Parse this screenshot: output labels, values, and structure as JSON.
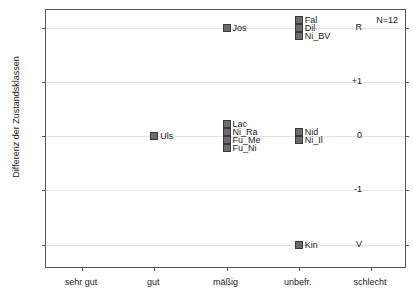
{
  "chart_data": {
    "type": "scatter",
    "title": "",
    "xlabel": "",
    "ylabel": "Differenz der Zustandsklassen",
    "annotation": "N=12",
    "grid": true,
    "legend": "none",
    "categories": [
      "sehr gut",
      "gut",
      "mäßig",
      "unbefr.",
      "schlecht"
    ],
    "ytick_labels": [
      "R",
      "+1",
      "0",
      "-1",
      "V"
    ],
    "ytick_values": [
      2,
      1,
      0,
      -1,
      -2
    ],
    "ylim": [
      -2.45,
      2.33
    ],
    "points": [
      {
        "label": "Uls",
        "category": "gut",
        "x": 1,
        "y": 0,
        "stack_index": 0,
        "stack_size": 1
      },
      {
        "label": "Jos",
        "category": "mäßig",
        "x": 2,
        "y": 2,
        "stack_index": 0,
        "stack_size": 1
      },
      {
        "label": "Lac",
        "category": "mäßig",
        "x": 2,
        "y": 0,
        "stack_index": 0,
        "stack_size": 4
      },
      {
        "label": "Ni_Ra",
        "category": "mäßig",
        "x": 2,
        "y": 0,
        "stack_index": 1,
        "stack_size": 4
      },
      {
        "label": "Fu_Me",
        "category": "mäßig",
        "x": 2,
        "y": 0,
        "stack_index": 2,
        "stack_size": 4
      },
      {
        "label": "Fu_Ni",
        "category": "mäßig",
        "x": 2,
        "y": 0,
        "stack_index": 3,
        "stack_size": 4
      },
      {
        "label": "Fal",
        "category": "unbefr.",
        "x": 3,
        "y": 2,
        "stack_index": 0,
        "stack_size": 3
      },
      {
        "label": "Dil",
        "category": "unbefr.",
        "x": 3,
        "y": 2,
        "stack_index": 1,
        "stack_size": 3
      },
      {
        "label": "Ni_BV",
        "category": "unbefr.",
        "x": 3,
        "y": 2,
        "stack_index": 2,
        "stack_size": 3
      },
      {
        "label": "Nid",
        "category": "unbefr.",
        "x": 3,
        "y": 0,
        "stack_index": 0,
        "stack_size": 2
      },
      {
        "label": "Ni_Il",
        "category": "unbefr.",
        "x": 3,
        "y": 0,
        "stack_index": 1,
        "stack_size": 2
      },
      {
        "label": "Kin",
        "category": "unbefr.",
        "x": 3,
        "y": -2,
        "stack_index": 0,
        "stack_size": 1
      }
    ],
    "colors": {
      "marker_fill": "#6b6b6e",
      "marker_edge": "#3a3a3c",
      "axis": "#58585a",
      "grid": "#e2e2e4",
      "text": "#1a1a1a",
      "background": "#ffffff"
    }
  }
}
